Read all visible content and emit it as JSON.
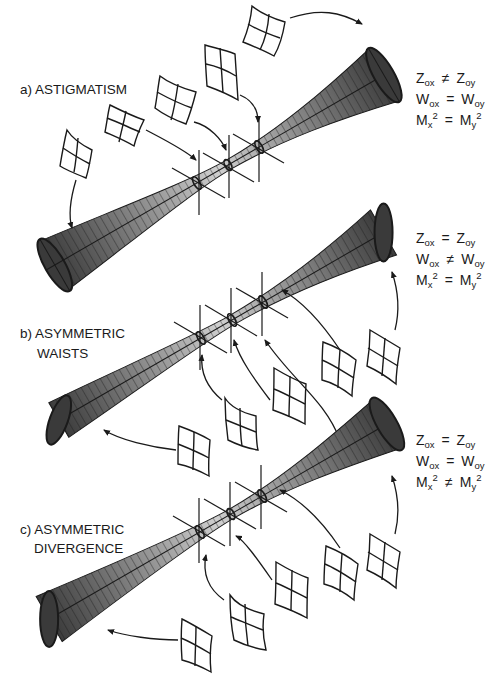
{
  "figure": {
    "panels": [
      {
        "id": "a",
        "label_lines": [
          "a) ASTIGMATISM"
        ],
        "equations": [
          {
            "lhs": "Z",
            "lhs_sub": "ox",
            "rel": "≠",
            "rhs": "Z",
            "rhs_sub": "oy"
          },
          {
            "lhs": "W",
            "lhs_sub": "ox",
            "rel": "=",
            "rhs": "W",
            "rhs_sub": "oy"
          },
          {
            "lhs": "M",
            "lhs_sub": "x",
            "lhs_sup": "2",
            "rel": "=",
            "rhs": "M",
            "rhs_sub": "y",
            "rhs_sup": "2"
          }
        ]
      },
      {
        "id": "b",
        "label_lines": [
          "b) ASYMMETRIC",
          "WAISTS"
        ],
        "equations": [
          {
            "lhs": "Z",
            "lhs_sub": "ox",
            "rel": "=",
            "rhs": "Z",
            "rhs_sub": "oy"
          },
          {
            "lhs": "W",
            "lhs_sub": "ox",
            "rel": "≠",
            "rhs": "W",
            "rhs_sub": "oy"
          },
          {
            "lhs": "M",
            "lhs_sub": "x",
            "lhs_sup": "2",
            "rel": "=",
            "rhs": "M",
            "rhs_sub": "y",
            "rhs_sup": "2"
          }
        ]
      },
      {
        "id": "c",
        "label_lines": [
          "c) ASYMMETRIC",
          "DIVERGENCE"
        ],
        "equations": [
          {
            "lhs": "Z",
            "lhs_sub": "ox",
            "rel": "=",
            "rhs": "Z",
            "rhs_sub": "oy"
          },
          {
            "lhs": "W",
            "lhs_sub": "ox",
            "rel": "=",
            "rhs": "W",
            "rhs_sub": "oy"
          },
          {
            "lhs": "M",
            "lhs_sub": "x",
            "lhs_sup": "2",
            "rel": "≠",
            "rhs": "M",
            "rhs_sub": "y",
            "rhs_sup": "2"
          }
        ]
      }
    ],
    "colors": {
      "beam_dark": "#3a3a3a",
      "beam_mid": "#8a8a8a",
      "beam_light": "#c8c8c8",
      "line": "#1a1a1a"
    }
  }
}
